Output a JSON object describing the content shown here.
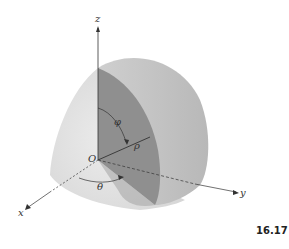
{
  "figure": {
    "number": "16.17",
    "axes": {
      "x": "x",
      "y": "y",
      "z": "z"
    },
    "origin_label": "O",
    "angle_phi": "φ",
    "radius_rho": "ρ",
    "angle_theta": "θ"
  },
  "colors": {
    "outer_surface": "#e2e2e2",
    "cut_face_dark": "#8f8f8f",
    "cut_face_mid": "#b5b5b5",
    "axis": "#333333"
  }
}
